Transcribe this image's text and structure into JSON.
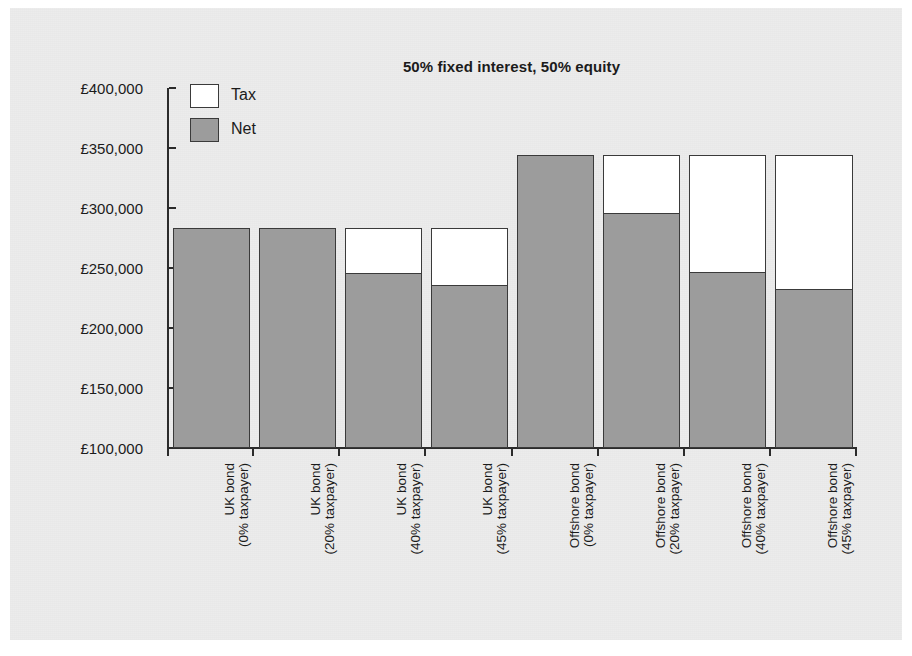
{
  "chart_data": {
    "type": "bar",
    "title": "50% fixed interest, 50% equity",
    "xlabel": "",
    "ylabel": "",
    "stacked": true,
    "grid": false,
    "legend_position": "top-left inside plot",
    "ylim": [
      100000,
      400000
    ],
    "ytick_labels": [
      "£400,000",
      "£350,000",
      "£300,000",
      "£250,000",
      "£200,000",
      "£150,000",
      "£100,000"
    ],
    "ytick_values": [
      400000,
      350000,
      300000,
      250000,
      200000,
      150000,
      100000
    ],
    "currency_symbol": "£",
    "categories": [
      {
        "line1": "UK bond",
        "line2": "(0% taxpayer)"
      },
      {
        "line1": "UK bond",
        "line2": "(20% taxpayer)"
      },
      {
        "line1": "UK bond",
        "line2": "(40% taxpayer)"
      },
      {
        "line1": "UK bond",
        "line2": "(45% taxpayer)"
      },
      {
        "line1": "Offshore bond",
        "line2": "(0% taxpayer)"
      },
      {
        "line1": "Offshore bond",
        "line2": "(20% taxpayer)"
      },
      {
        "line1": "Offshore bond",
        "line2": "(40% taxpayer)"
      },
      {
        "line1": "Offshore bond",
        "line2": "(45% taxpayer)"
      }
    ],
    "series": [
      {
        "name": "Net",
        "color": "#9c9c9c",
        "values": [
          283000,
          283000,
          246000,
          236000,
          344000,
          296000,
          247000,
          233000
        ]
      },
      {
        "name": "Tax",
        "color": "#ffffff",
        "values": [
          0,
          0,
          37000,
          47000,
          0,
          48000,
          97000,
          111000
        ]
      }
    ],
    "totals": [
      283000,
      283000,
      283000,
      283000,
      344000,
      344000,
      344000,
      344000
    ]
  },
  "legend": {
    "items": [
      {
        "label": "Tax",
        "swatch": "white"
      },
      {
        "label": "Net",
        "swatch": "grey"
      }
    ]
  },
  "colors": {
    "net_fill": "#9c9c9c",
    "tax_fill": "#ffffff",
    "outline": "#3a3a3a",
    "axis": "#2b2b2b",
    "panel_background": "#ececec",
    "text": "#1b1b1b"
  }
}
